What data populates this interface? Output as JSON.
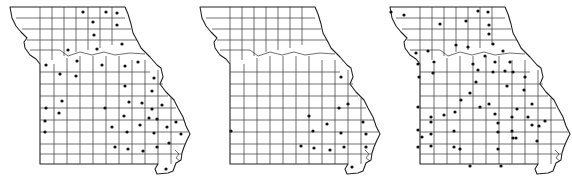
{
  "figure": {
    "colors": {
      "background": "#ffffff",
      "line": "#222222",
      "dot": "#111111"
    }
  },
  "maps": [
    {
      "id": "map-1",
      "offset_x": 0,
      "dot_count": 45,
      "dots": [
        [
          83,
          12
        ],
        [
          106,
          12
        ],
        [
          117,
          13
        ],
        [
          93,
          22
        ],
        [
          117,
          25
        ],
        [
          94,
          35
        ],
        [
          68,
          50
        ],
        [
          97,
          49
        ],
        [
          122,
          44
        ],
        [
          77,
          61
        ],
        [
          46,
          65
        ],
        [
          102,
          65
        ],
        [
          125,
          66
        ],
        [
          138,
          62
        ],
        [
          60,
          74
        ],
        [
          76,
          76
        ],
        [
          154,
          78
        ],
        [
          125,
          86
        ],
        [
          152,
          91
        ],
        [
          62,
          101
        ],
        [
          129,
          102
        ],
        [
          142,
          103
        ],
        [
          162,
          105
        ],
        [
          152,
          109
        ],
        [
          46,
          108
        ],
        [
          105,
          108
        ],
        [
          59,
          113
        ],
        [
          124,
          116
        ],
        [
          149,
          118
        ],
        [
          157,
          119
        ],
        [
          176,
          122
        ],
        [
          45,
          121
        ],
        [
          140,
          125
        ],
        [
          167,
          127
        ],
        [
          112,
          127
        ],
        [
          181,
          134
        ],
        [
          45,
          132
        ],
        [
          127,
          132
        ],
        [
          154,
          133
        ],
        [
          169,
          143
        ],
        [
          115,
          147
        ],
        [
          128,
          149
        ],
        [
          143,
          151
        ],
        [
          157,
          147
        ],
        [
          166,
          169
        ]
      ]
    },
    {
      "id": "map-2",
      "offset_x": 190,
      "dot_count": 16,
      "dots": [
        [
          341,
          77
        ],
        [
          339,
          108
        ],
        [
          348,
          104
        ],
        [
          309,
          116
        ],
        [
          327,
          124
        ],
        [
          363,
          122
        ],
        [
          231,
          131
        ],
        [
          313,
          131
        ],
        [
          341,
          133
        ],
        [
          366,
          134
        ],
        [
          301,
          146
        ],
        [
          314,
          148
        ],
        [
          330,
          150
        ],
        [
          344,
          147
        ],
        [
          366,
          147
        ],
        [
          352,
          167
        ]
      ]
    },
    {
      "id": "map-3",
      "offset_x": 380,
      "dot_count": 62,
      "dots": [
        [
          391,
          12
        ],
        [
          404,
          15
        ],
        [
          440,
          24
        ],
        [
          466,
          21
        ],
        [
          478,
          11
        ],
        [
          488,
          12
        ],
        [
          489,
          25
        ],
        [
          489,
          34
        ],
        [
          493,
          44
        ],
        [
          456,
          45
        ],
        [
          468,
          47
        ],
        [
          503,
          51
        ],
        [
          416,
          53
        ],
        [
          428,
          51
        ],
        [
          418,
          64
        ],
        [
          434,
          62
        ],
        [
          485,
          56
        ],
        [
          473,
          64
        ],
        [
          478,
          70
        ],
        [
          495,
          62
        ],
        [
          510,
          62
        ],
        [
          505,
          71
        ],
        [
          513,
          72
        ],
        [
          493,
          72
        ],
        [
          419,
          77
        ],
        [
          433,
          73
        ],
        [
          525,
          77
        ],
        [
          476,
          82
        ],
        [
          470,
          93
        ],
        [
          507,
          86
        ],
        [
          524,
          90
        ],
        [
          461,
          100
        ],
        [
          480,
          107
        ],
        [
          489,
          104
        ],
        [
          532,
          104
        ],
        [
          517,
          109
        ],
        [
          418,
          107
        ],
        [
          444,
          115
        ],
        [
          455,
          112
        ],
        [
          431,
          117
        ],
        [
          495,
          114
        ],
        [
          512,
          117
        ],
        [
          528,
          117
        ],
        [
          545,
          121
        ],
        [
          498,
          123
        ],
        [
          532,
          125
        ],
        [
          418,
          130
        ],
        [
          431,
          122
        ],
        [
          512,
          131
        ],
        [
          539,
          126
        ],
        [
          498,
          132
        ],
        [
          454,
          131
        ],
        [
          422,
          137
        ],
        [
          431,
          134
        ],
        [
          513,
          138
        ],
        [
          460,
          149
        ],
        [
          418,
          147
        ],
        [
          431,
          146
        ],
        [
          454,
          147
        ],
        [
          498,
          149
        ],
        [
          516,
          138
        ],
        [
          537,
          141
        ],
        [
          470,
          166
        ],
        [
          501,
          166
        ]
      ]
    }
  ]
}
